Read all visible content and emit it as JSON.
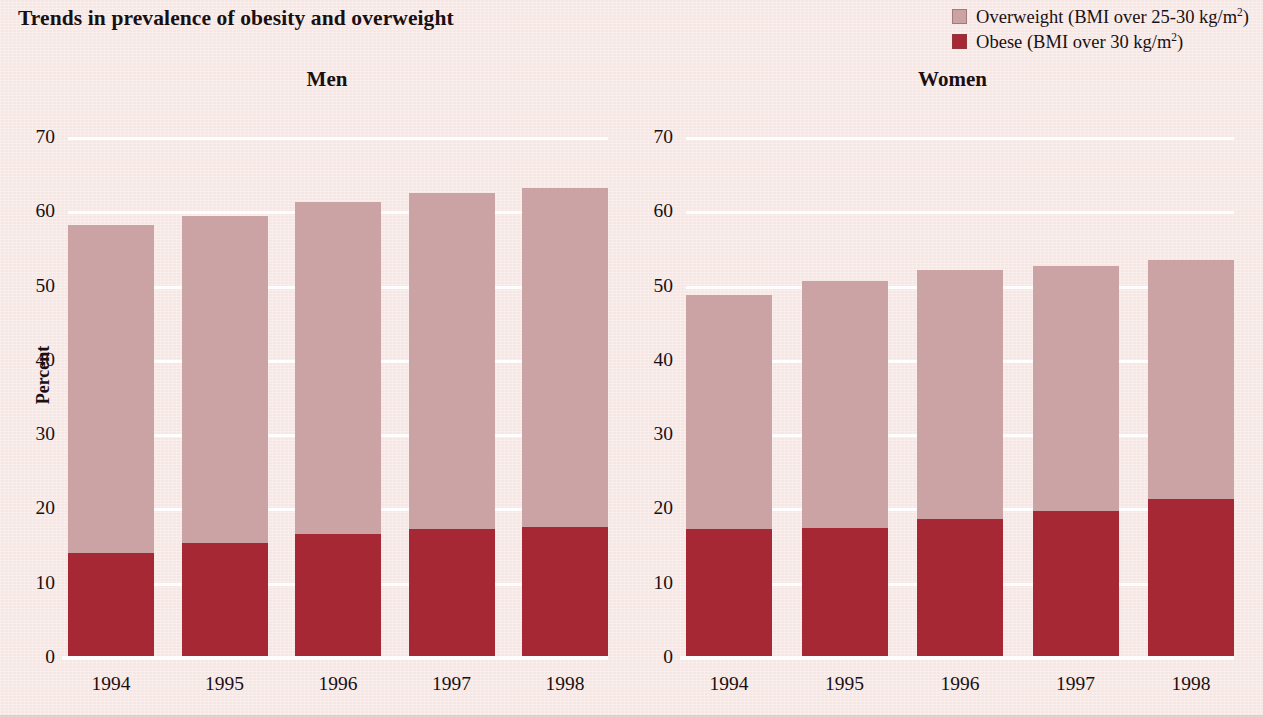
{
  "title": "Trends in prevalence of obesity and overweight",
  "colors": {
    "background": "#F7E7E4",
    "overweight": "#CBA3A4",
    "obese": "#A52834",
    "gridline": "#FFFFFF",
    "text": "#1A1012"
  },
  "legend": {
    "items": [
      {
        "label_prefix": "Overweight (BMI over 25-30 kg/m",
        "label_sup": "2",
        "label_suffix": ")",
        "color": "#CBA3A4",
        "key": "overweight"
      },
      {
        "label_prefix": "Obese (BMI over 30 kg/m",
        "label_sup": "2",
        "label_suffix": ")",
        "color": "#A52834",
        "key": "obese"
      }
    ]
  },
  "panels": [
    {
      "title": "Men",
      "y_axis_label": "Percent"
    },
    {
      "title": "Women",
      "y_axis_label": ""
    }
  ],
  "axis": {
    "y_ticks": [
      "70",
      "60",
      "50",
      "40",
      "30",
      "20",
      "10",
      "0"
    ],
    "x_ticks": [
      "1994",
      "1995",
      "1996",
      "1997",
      "1998"
    ]
  },
  "chart_data": [
    {
      "type": "bar",
      "title": "Men",
      "subtitle": "Trends in prevalence of obesity and overweight",
      "stacked": true,
      "categories": [
        "1994",
        "1995",
        "1996",
        "1997",
        "1998"
      ],
      "series": [
        {
          "name": "Obese (BMI over 30 kg/m2)",
          "color": "#A52834",
          "values": [
            14.0,
            15.4,
            16.6,
            17.2,
            17.5
          ]
        },
        {
          "name": "Overweight (BMI over 25-30 kg/m2)",
          "color": "#CBA3A4",
          "values": [
            44.2,
            44.0,
            44.6,
            45.3,
            45.6
          ]
        }
      ],
      "totals": [
        58.2,
        59.4,
        61.2,
        62.5,
        63.1
      ],
      "xlabel": "",
      "ylabel": "Percent",
      "ylim": [
        0,
        70
      ],
      "ytick_step": 10,
      "grid": true,
      "legend_position": "top-right"
    },
    {
      "type": "bar",
      "title": "Women",
      "subtitle": "Trends in prevalence of obesity and overweight",
      "stacked": true,
      "categories": [
        "1994",
        "1995",
        "1996",
        "1997",
        "1998"
      ],
      "series": [
        {
          "name": "Obese (BMI over 30 kg/m2)",
          "color": "#A52834",
          "values": [
            17.3,
            17.4,
            18.6,
            19.7,
            21.3
          ]
        },
        {
          "name": "Overweight (BMI over 25-30 kg/m2)",
          "color": "#CBA3A4",
          "values": [
            31.5,
            33.2,
            33.5,
            32.9,
            32.2
          ]
        }
      ],
      "totals": [
        48.8,
        50.6,
        52.1,
        52.6,
        53.5
      ],
      "xlabel": "",
      "ylabel": "",
      "ylim": [
        0,
        70
      ],
      "ytick_step": 10,
      "grid": true,
      "legend_position": "top-right"
    }
  ]
}
